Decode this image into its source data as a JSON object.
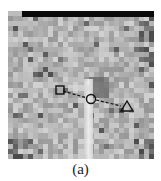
{
  "figure": {
    "caption": "(a)",
    "image_description": "Pixelated grayscale image patch with a bright vertical stripe; three markers connected by a dashed line",
    "markers": [
      {
        "shape": "square",
        "x": 60,
        "y": 90
      },
      {
        "shape": "circle",
        "x": 91,
        "y": 99
      },
      {
        "shape": "triangle",
        "x": 127,
        "y": 107
      }
    ],
    "connector": "dashed-line",
    "colors": {
      "marker_stroke": "#111111",
      "top_bar": "#0a0a0a",
      "background_gray": "#a8a8a8"
    }
  }
}
